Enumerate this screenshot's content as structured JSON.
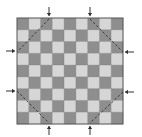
{
  "diagram": {
    "type": "checkerboard",
    "rows": 9,
    "cols": 9,
    "grid": {
      "x": 17,
      "y": 18,
      "size": 106
    },
    "top_left_dark": true,
    "colors": {
      "dark": "#8e8e8e",
      "light": "#d6d6d6",
      "grid_line": "#6a6a6a",
      "border": "#555555",
      "arrow": "#333333",
      "dashed_line": "#3a3a3a"
    },
    "arrows": [
      {
        "side": "top",
        "pos": 49
      },
      {
        "side": "top",
        "pos": 90
      },
      {
        "side": "bottom",
        "pos": 49
      },
      {
        "side": "bottom",
        "pos": 90
      },
      {
        "side": "left",
        "pos": 51
      },
      {
        "side": "left",
        "pos": 91
      },
      {
        "side": "right",
        "pos": 52
      },
      {
        "side": "right",
        "pos": 92
      }
    ],
    "dashed_diagonals": [
      {
        "corner": "top-left",
        "from": [
          49,
          19
        ],
        "to": [
          17,
          52
        ]
      },
      {
        "corner": "top-right",
        "from": [
          90,
          19
        ],
        "to": [
          123,
          52
        ]
      },
      {
        "corner": "bottom-left",
        "from": [
          17,
          91
        ],
        "to": [
          49,
          123
        ]
      },
      {
        "corner": "bottom-right",
        "from": [
          123,
          92
        ],
        "to": [
          90,
          123
        ]
      }
    ]
  }
}
